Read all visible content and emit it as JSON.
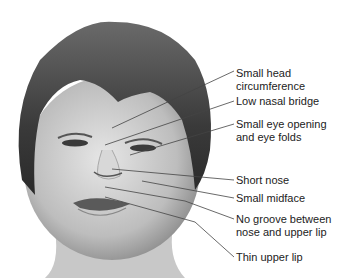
{
  "figure": {
    "labels": [
      {
        "id": "small-head",
        "lines": [
          "Small head",
          "circumference"
        ],
        "top": 67,
        "line": [
          120,
          126,
          234,
          71
        ]
      },
      {
        "id": "low-nasal-bridge",
        "lines": [
          "Low nasal bridge"
        ],
        "top": 95,
        "line": [
          105,
          145,
          234,
          101
        ]
      },
      {
        "id": "small-eye-opening",
        "lines": [
          "Small eye opening",
          "and eye folds"
        ],
        "top": 114,
        "line": [
          130,
          155,
          234,
          124
        ]
      },
      {
        "id": "short-nose",
        "lines": [
          "Short nose"
        ],
        "top": 175,
        "line": [
          112,
          169,
          234,
          180
        ]
      },
      {
        "id": "small-midface",
        "lines": [
          "Small midface"
        ],
        "top": 192,
        "line": [
          142,
          181,
          234,
          198
        ]
      },
      {
        "id": "no-groove",
        "lines": [
          "No groove between",
          "nose and upper lip"
        ],
        "top": 212,
        "line": [
          105,
          187,
          185,
          201,
          234,
          219
        ]
      },
      {
        "id": "thin-upper-lip",
        "lines": [
          "Thin upper lip"
        ],
        "top": 251,
        "line": [
          105,
          197,
          195,
          222,
          234,
          257
        ]
      }
    ]
  }
}
